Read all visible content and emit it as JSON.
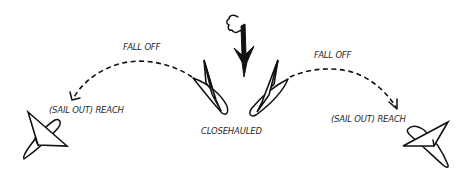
{
  "diagram": {
    "wind_indicator": {
      "icon": "wind-cloud-arrow-icon",
      "direction": "down"
    },
    "labels": {
      "fall_off_left": "FALL OFF",
      "fall_off_right": "FALL OFF",
      "reach_left": "(SAIL OUT) REACH",
      "reach_right": "(SAIL OUT) REACH",
      "closehauled": "CLOSEHAULED"
    },
    "boats": [
      {
        "name": "closehauled-port",
        "point_of_sail": "closehauled"
      },
      {
        "name": "closehauled-starboard",
        "point_of_sail": "closehauled"
      },
      {
        "name": "reach-left",
        "point_of_sail": "reach"
      },
      {
        "name": "reach-right",
        "point_of_sail": "reach"
      }
    ],
    "transitions": [
      {
        "from": "closehauled-port",
        "to": "reach-left",
        "label": "FALL OFF",
        "style": "dashed-arrow"
      },
      {
        "from": "closehauled-starboard",
        "to": "reach-right",
        "label": "FALL OFF",
        "style": "dashed-arrow"
      }
    ],
    "colors": {
      "ink": "#111111",
      "text": "#2a2a2a",
      "background": "#ffffff"
    }
  }
}
